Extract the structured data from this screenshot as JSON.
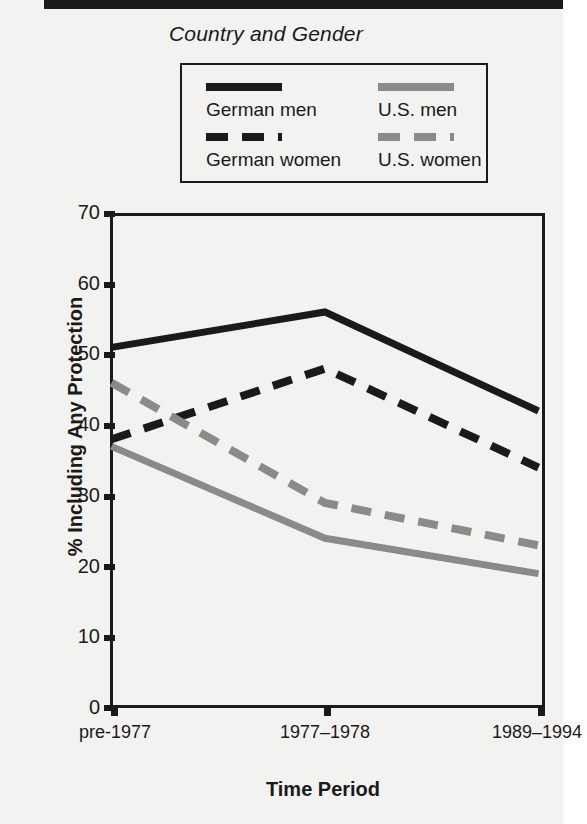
{
  "legend": {
    "title": "Country and Gender",
    "entries": [
      {
        "label": "German men",
        "style": "solid-black",
        "color": "#1a1a1a"
      },
      {
        "label": "U.S. men",
        "style": "solid-gray",
        "color": "#8a8a8a"
      },
      {
        "label": "German women",
        "style": "dash-black",
        "color": "#1a1a1a"
      },
      {
        "label": "U.S. women",
        "style": "dash-gray",
        "color": "#8a8a8a"
      }
    ]
  },
  "axes": {
    "ylabel": "% Including Any Protection",
    "xlabel": "Time Period",
    "yticks": [
      "0",
      "10",
      "20",
      "30",
      "40",
      "50",
      "60",
      "70"
    ],
    "xticks": [
      "pre-1977",
      "1977–1978",
      "1989–1994"
    ]
  },
  "chart_data": {
    "type": "line",
    "title": "",
    "xlabel": "Time Period",
    "ylabel": "% Including Any Protection",
    "categories": [
      "pre-1977",
      "1977–1978",
      "1989–1994"
    ],
    "ylim": [
      0,
      70
    ],
    "yticks": [
      0,
      10,
      20,
      30,
      40,
      50,
      60,
      70
    ],
    "grid": false,
    "legend_position": "top",
    "legend_title": "Country and Gender",
    "series": [
      {
        "name": "German men",
        "values": [
          51,
          56,
          42
        ],
        "color": "#1a1a1a",
        "dash": "solid"
      },
      {
        "name": "German women",
        "values": [
          38,
          48,
          34
        ],
        "color": "#1a1a1a",
        "dash": "dashed"
      },
      {
        "name": "U.S. men",
        "values": [
          37,
          24,
          19
        ],
        "color": "#8a8a8a",
        "dash": "solid"
      },
      {
        "name": "U.S. women",
        "values": [
          46,
          29,
          23
        ],
        "color": "#8a8a8a",
        "dash": "dashed"
      }
    ]
  }
}
